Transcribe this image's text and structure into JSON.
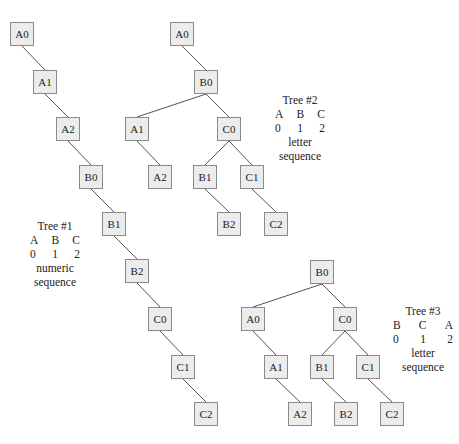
{
  "trees": [
    {
      "id": "tree1",
      "legend": {
        "title": "Tree #1",
        "letters": [
          "A",
          "B",
          "C"
        ],
        "numbers": [
          "0",
          "1",
          "2"
        ],
        "caption_line1": "numeric",
        "caption_line2": "sequence"
      },
      "nodes": [
        {
          "label": "A0",
          "x": 10,
          "y": 22
        },
        {
          "label": "A1",
          "x": 33,
          "y": 70
        },
        {
          "label": "A2",
          "x": 56,
          "y": 117
        },
        {
          "label": "B0",
          "x": 79,
          "y": 165
        },
        {
          "label": "B1",
          "x": 102,
          "y": 212
        },
        {
          "label": "B2",
          "x": 125,
          "y": 259
        },
        {
          "label": "C0",
          "x": 148,
          "y": 307
        },
        {
          "label": "C1",
          "x": 171,
          "y": 355
        },
        {
          "label": "C2",
          "x": 194,
          "y": 402
        }
      ],
      "edges": [
        [
          "A0",
          "A1"
        ],
        [
          "A1",
          "A2"
        ],
        [
          "A2",
          "B0"
        ],
        [
          "B0",
          "B1"
        ],
        [
          "B1",
          "B2"
        ],
        [
          "B2",
          "C0"
        ],
        [
          "C0",
          "C1"
        ],
        [
          "C1",
          "C2"
        ]
      ]
    },
    {
      "id": "tree2",
      "legend": {
        "title": "Tree #2",
        "letters": [
          "A",
          "B",
          "C"
        ],
        "numbers": [
          "0",
          "1",
          "2"
        ],
        "caption_line1": "letter",
        "caption_line2": "sequence"
      },
      "nodes": [
        {
          "label": "A0",
          "x": 170,
          "y": 22
        },
        {
          "label": "B0",
          "x": 194,
          "y": 70
        },
        {
          "label": "A1",
          "x": 125,
          "y": 117
        },
        {
          "label": "C0",
          "x": 217,
          "y": 117
        },
        {
          "label": "A2",
          "x": 148,
          "y": 165
        },
        {
          "label": "B1",
          "x": 193,
          "y": 165
        },
        {
          "label": "C1",
          "x": 240,
          "y": 165
        },
        {
          "label": "B2",
          "x": 217,
          "y": 212
        },
        {
          "label": "C2",
          "x": 264,
          "y": 212
        }
      ],
      "edges": [
        [
          "A0",
          "B0"
        ],
        [
          "B0",
          "A1"
        ],
        [
          "B0",
          "C0"
        ],
        [
          "A1",
          "A2"
        ],
        [
          "C0",
          "B1"
        ],
        [
          "C0",
          "C1"
        ],
        [
          "B1",
          "B2"
        ],
        [
          "C1",
          "C2"
        ]
      ]
    },
    {
      "id": "tree3",
      "legend": {
        "title": "Tree #3",
        "letters": [
          "B",
          "C",
          "A"
        ],
        "numbers": [
          "0",
          "1",
          "2"
        ],
        "caption_line1": "letter",
        "caption_line2": "sequence"
      },
      "nodes": [
        {
          "label": "B0",
          "x": 310,
          "y": 260
        },
        {
          "label": "A0",
          "x": 241,
          "y": 307
        },
        {
          "label": "C0",
          "x": 333,
          "y": 307
        },
        {
          "label": "A1",
          "x": 264,
          "y": 355
        },
        {
          "label": "B1",
          "x": 310,
          "y": 355
        },
        {
          "label": "C1",
          "x": 356,
          "y": 355
        },
        {
          "label": "A2",
          "x": 288,
          "y": 402
        },
        {
          "label": "B2",
          "x": 334,
          "y": 402
        },
        {
          "label": "C2",
          "x": 380,
          "y": 402
        }
      ],
      "edges": [
        [
          "B0",
          "A0"
        ],
        [
          "B0",
          "C0"
        ],
        [
          "A0",
          "A1"
        ],
        [
          "A1",
          "A2"
        ],
        [
          "C0",
          "B1"
        ],
        [
          "C0",
          "C1"
        ],
        [
          "B1",
          "B2"
        ],
        [
          "C1",
          "C2"
        ]
      ]
    }
  ],
  "legend_positions": {
    "tree1": {
      "x": 30,
      "y": 219,
      "w": 50
    },
    "tree2": {
      "x": 275,
      "y": 93,
      "w": 50
    },
    "tree3": {
      "x": 393,
      "y": 304,
      "w": 60
    }
  },
  "colors": {
    "node_fill": "#ececec",
    "node_border": "#8a8a8a",
    "edge": "#555555",
    "text": "#222222"
  }
}
